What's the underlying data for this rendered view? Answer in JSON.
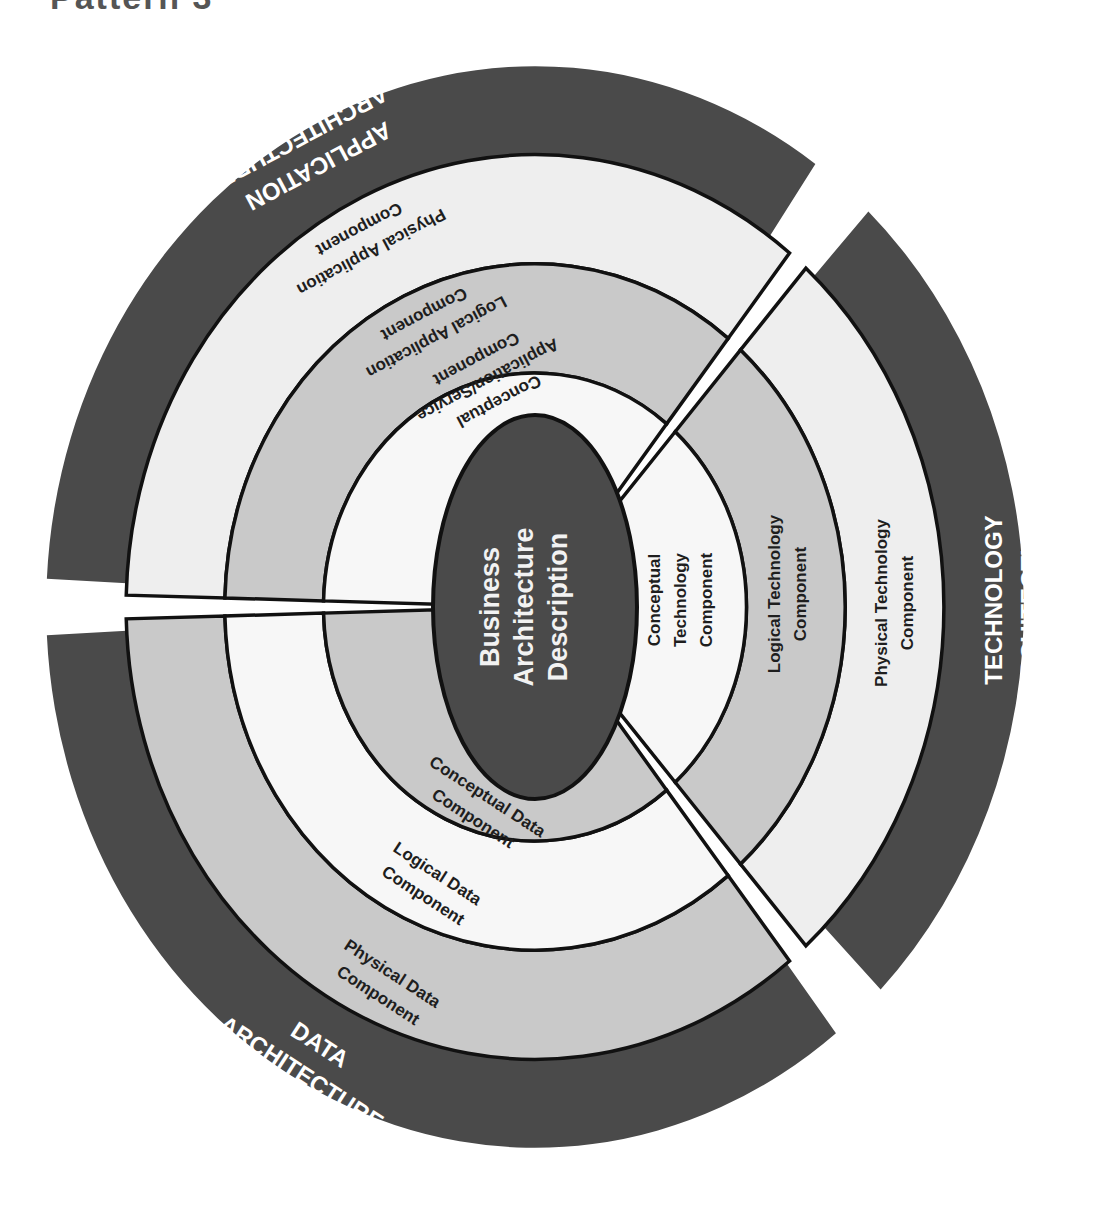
{
  "title_fragment": "Pattern 3",
  "colors": {
    "dark": "#4a4a4a",
    "light": "#eeeeee",
    "medium": "#c9c9c9",
    "white": "#f7f7f7",
    "stroke": "#111111",
    "core": "#4a4a4a"
  },
  "core": {
    "lines": [
      "Business",
      "Architecture",
      "Description"
    ]
  },
  "application": {
    "architecture_label": [
      "Application",
      "Architecture"
    ],
    "rings": [
      {
        "name": "physical",
        "lines": [
          "Physical Application",
          "Component"
        ]
      },
      {
        "name": "logical",
        "lines": [
          "Logical Application",
          "Component"
        ]
      },
      {
        "name": "conceptual",
        "lines": [
          "Conceptual",
          "Application/Service",
          "Component"
        ]
      }
    ]
  },
  "technology": {
    "architecture_label": [
      "Technology",
      "Architecture"
    ],
    "rings": [
      {
        "name": "conceptual",
        "lines": [
          "Conceptual",
          "Technology",
          "Component"
        ]
      },
      {
        "name": "logical",
        "lines": [
          "Logical Technology",
          "Component"
        ]
      },
      {
        "name": "physical",
        "lines": [
          "Physical Technology",
          "Component"
        ]
      }
    ]
  },
  "data": {
    "architecture_label": [
      "Data",
      "Architecture"
    ],
    "rings": [
      {
        "name": "conceptual",
        "lines": [
          "Conceptual Data",
          "Component"
        ]
      },
      {
        "name": "logical",
        "lines": [
          "Logical Data",
          "Component"
        ]
      },
      {
        "name": "physical",
        "lines": [
          "Physical Data",
          "Component"
        ]
      }
    ]
  }
}
